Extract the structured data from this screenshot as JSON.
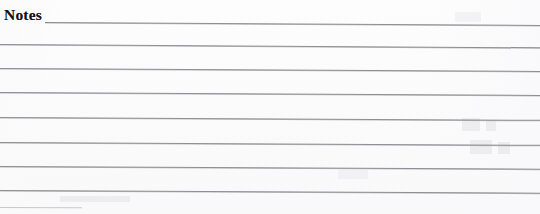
{
  "document": {
    "section_title": "Notes",
    "paper_color": "#fdfdfd",
    "rule_color": "#8f8f93",
    "text_color": "#141414",
    "width": 540,
    "height": 214
  },
  "notes_area": {
    "label": "Notes",
    "line_count": 8,
    "writing_lines": [
      {
        "id": "line-1",
        "left": 45,
        "top": 22,
        "width": 495,
        "skew_deg": 0.35,
        "emphasis": "normal"
      },
      {
        "id": "line-2",
        "left": 0,
        "top": 44,
        "width": 540,
        "skew_deg": 0.35,
        "emphasis": "normal"
      },
      {
        "id": "line-3",
        "left": 0,
        "top": 68,
        "width": 540,
        "skew_deg": 0.32,
        "emphasis": "normal"
      },
      {
        "id": "line-4",
        "top": 92,
        "left": 0,
        "width": 540,
        "skew_deg": 0.32,
        "emphasis": "normal"
      },
      {
        "id": "line-5",
        "left": 0,
        "top": 117,
        "width": 540,
        "skew_deg": 0.3,
        "emphasis": "normal"
      },
      {
        "id": "line-6",
        "left": 0,
        "top": 142,
        "width": 540,
        "skew_deg": 0.3,
        "emphasis": "normal"
      },
      {
        "id": "line-7",
        "left": 0,
        "top": 166,
        "width": 540,
        "skew_deg": 0.28,
        "emphasis": "normal"
      },
      {
        "id": "line-8",
        "left": 0,
        "top": 190,
        "width": 540,
        "skew_deg": 0.28,
        "emphasis": "normal"
      }
    ],
    "partial_bottom_line": {
      "id": "line-9-partial",
      "left": 0,
      "top": 207,
      "width": 82,
      "skew_deg": 0.2
    },
    "entered_text": ""
  }
}
